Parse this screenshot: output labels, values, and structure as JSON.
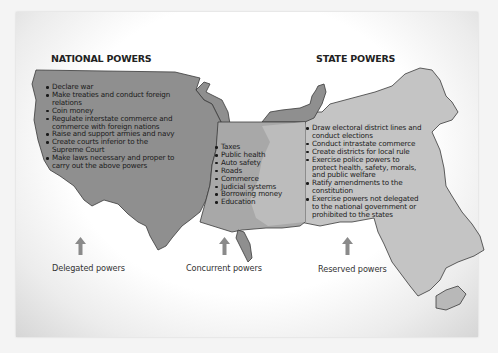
{
  "headings": {
    "national": "NATIONAL POWERS",
    "state": "STATE POWERS"
  },
  "national_powers": [
    "Declare war",
    "Make treaties and conduct foreign relations",
    "Coin money",
    "Regulate interstate commerce and commerce with foreign nations",
    "Raise and support armies and navy",
    "Create courts inferior to the Supreme Court",
    "Make laws necessary and proper to carry out the above powers"
  ],
  "concurrent_powers": [
    "Taxes",
    "Public health",
    "Auto safety",
    "Roads",
    "Commerce",
    "Judicial systems",
    "Borrowing money",
    "Education"
  ],
  "state_powers": [
    "Draw electoral district lines and conduct  elections",
    "Conduct intrastate commerce",
    "Create districts for local rule",
    "Exercise police powers to protect health, safety, morals, and public welfare",
    "Ratify amendments to the constitution",
    "Exercise powers not delegated to the national government or prohibited to the states"
  ],
  "arrow_labels": {
    "delegated": "Delegated powers",
    "concurrent": "Concurrent powers",
    "reserved": "Reserved powers"
  },
  "colors": {
    "national_fill": "#8f8f8f",
    "concurrent_fill": "#a8a8a8",
    "state_fill": "#c4c4c4",
    "outline": "#3a3a3a",
    "arrow": "#8a8a8a"
  }
}
